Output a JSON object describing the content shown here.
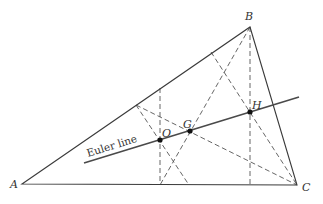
{
  "diagram": {
    "vertices": {
      "A": {
        "label": "A",
        "x": 22,
        "y": 184
      },
      "B": {
        "label": "B",
        "x": 250,
        "y": 27
      },
      "C": {
        "label": "C",
        "x": 297,
        "y": 185
      }
    },
    "centers": {
      "O": {
        "label": "O",
        "name": "circumcenter",
        "x": 160,
        "y": 140
      },
      "G": {
        "label": "G",
        "name": "centroid",
        "x": 190,
        "y": 131
      },
      "H": {
        "label": "H",
        "name": "orthocenter",
        "x": 250,
        "y": 112
      }
    },
    "euler_line": {
      "label": "Euler line",
      "x1": 84,
      "y1": 163,
      "x2": 299,
      "y2": 97
    },
    "dashed_lines": [
      {
        "name": "perpendicular-bisector-ac",
        "x1": 160,
        "y1": 88,
        "x2": 160,
        "y2": 185
      },
      {
        "name": "perpendicular-bisector-ab",
        "x1": 136,
        "y1": 105,
        "x2": 189,
        "y2": 185
      },
      {
        "name": "altitude-from-b",
        "x1": 250,
        "y1": 27,
        "x2": 250,
        "y2": 185
      },
      {
        "name": "altitude-from-c",
        "x1": 211,
        "y1": 52,
        "x2": 297,
        "y2": 185
      },
      {
        "name": "median-from-b",
        "x1": 250,
        "y1": 27,
        "x2": 160,
        "y2": 185
      },
      {
        "name": "median-from-c",
        "x1": 136,
        "y1": 105,
        "x2": 297,
        "y2": 185
      }
    ],
    "colors": {
      "line": "#3a3a3a",
      "dash": "#555555",
      "point": "#111111",
      "background": "#ffffff"
    }
  }
}
